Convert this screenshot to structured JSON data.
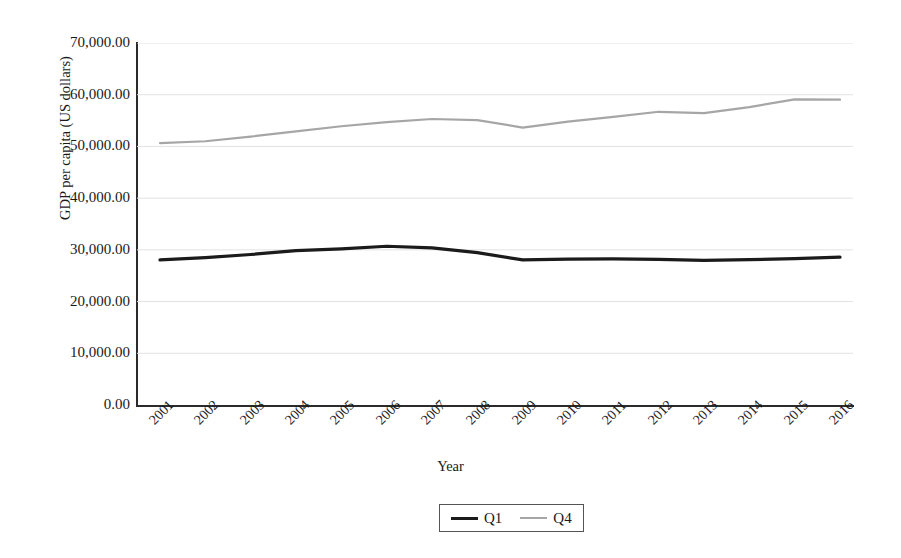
{
  "chart_data": {
    "type": "line",
    "title": "",
    "xlabel": "Year",
    "ylabel": "GDP per capita (US dollars)",
    "categories": [
      "2001",
      "2002",
      "2003",
      "2004",
      "2005",
      "2006",
      "2007",
      "2008",
      "2009",
      "2010",
      "2011",
      "2012",
      "2013",
      "2014",
      "2015",
      "2016"
    ],
    "x_tick_labels": [
      "2001",
      "2002",
      "2003",
      "2004",
      "2005",
      "2006",
      "2007",
      "2008",
      "2009",
      "2010",
      "2011",
      "2012",
      "2013",
      "2014",
      "2015",
      "2016"
    ],
    "y_tick_labels": [
      "70,000.00",
      "60,000.00",
      "50,000.00",
      "40,000.00",
      "30,000.00",
      "20,000.00",
      "10,000.00",
      "0.00"
    ],
    "y_tick_values": [
      70000,
      60000,
      50000,
      40000,
      30000,
      20000,
      10000,
      0
    ],
    "ylim": [
      0,
      70000
    ],
    "ystep": 10000,
    "grid": "horizontal",
    "legend_position": "bottom-center",
    "series": [
      {
        "name": "Q1",
        "color": "#1b1b1b",
        "width": 3.2,
        "values": [
          28050,
          28500,
          29100,
          29850,
          30200,
          30700,
          30400,
          29450,
          28050,
          28200,
          28250,
          28150,
          27950,
          28100,
          28300,
          28600
        ]
      },
      {
        "name": "Q4",
        "color": "#a6a6a6",
        "width": 2.2,
        "values": [
          50650,
          51000,
          51900,
          52900,
          53900,
          54700,
          55300,
          55100,
          53650,
          54800,
          55700,
          56700,
          56450,
          57600,
          59100,
          59050
        ]
      }
    ]
  },
  "legend": {
    "entries": [
      {
        "label": "Q1"
      },
      {
        "label": "Q4"
      }
    ]
  },
  "colors": {
    "q1_line": "#1b1b1b",
    "q4_line": "#a6a6a6",
    "axis": "#2b2b2b",
    "grid": "#e2e2e2",
    "text": "#1a1a1a",
    "background": "#ffffff"
  }
}
